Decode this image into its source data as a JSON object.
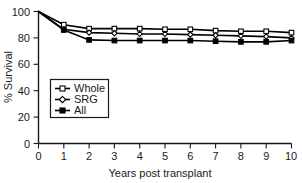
{
  "chart_data": {
    "type": "line",
    "title": "",
    "xlabel": "Years post transplant",
    "ylabel": "% Survival",
    "xlim": [
      0,
      10
    ],
    "ylim": [
      0,
      100
    ],
    "x": [
      0,
      1,
      2,
      3,
      4,
      5,
      6,
      7,
      8,
      9,
      10
    ],
    "xticks": [
      "0",
      "1",
      "2",
      "3",
      "4",
      "5",
      "6",
      "7",
      "8",
      "9",
      "10"
    ],
    "yticks": [
      "0",
      "20",
      "40",
      "60",
      "80",
      "100"
    ],
    "grid": false,
    "legend_position": "lower-left-inside",
    "series": [
      {
        "name": "Whole",
        "marker": "open-square",
        "values": [
          100,
          90,
          87,
          87,
          87,
          86.5,
          86.5,
          85.5,
          85,
          85,
          84
        ]
      },
      {
        "name": "SRG",
        "marker": "open-diamond",
        "values": [
          100,
          86.5,
          84,
          83.5,
          83,
          83,
          82.5,
          82,
          81.5,
          81,
          80
        ]
      },
      {
        "name": "All",
        "marker": "filled-square",
        "values": [
          100,
          86,
          78.5,
          78,
          78,
          78,
          78,
          77.5,
          77,
          77,
          78
        ]
      }
    ]
  },
  "legend": {
    "items": [
      {
        "label": "Whole"
      },
      {
        "label": "SRG"
      },
      {
        "label": "All"
      }
    ]
  },
  "axes": {
    "x_title": "Years post transplant",
    "y_title": "% Survival"
  },
  "colors": {
    "line": "#000000",
    "axis": "#1a1a1a",
    "background": "#ffffff"
  }
}
